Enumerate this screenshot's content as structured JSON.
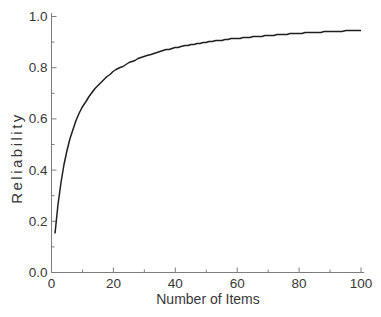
{
  "figure": {
    "background": "#ffffff",
    "axis_color": "#7d7d7d",
    "curve_color": "#1e1e1e",
    "text_color": "#383838"
  },
  "chart_data": {
    "type": "line",
    "title": "",
    "xlabel": "Number of Items",
    "ylabel": "Reliability",
    "xlim": [
      0,
      100
    ],
    "ylim": [
      0.0,
      1.0
    ],
    "grid": false,
    "legend": "none",
    "x_major_ticks": [
      0,
      20,
      40,
      60,
      80,
      100
    ],
    "x_major_tick_labels": [
      "0",
      "20",
      "40",
      "60",
      "80",
      "100"
    ],
    "x_minor_ticks": [
      10,
      30,
      50,
      70,
      90
    ],
    "y_major_ticks": [
      0.0,
      0.2,
      0.4,
      0.6,
      0.8,
      1.0
    ],
    "y_major_tick_labels": [
      "0.0",
      "0.2",
      "0.4",
      "0.6",
      "0.8",
      "1.0"
    ],
    "y_minor_ticks": [
      0.1,
      0.3,
      0.5,
      0.7,
      0.9
    ],
    "series": [
      {
        "name": "Reliability as a function of number of items (Spearman-Brown prophecy curve)",
        "model": "spearman_brown",
        "single_item_reliability": 0.155,
        "x_start": 1,
        "x_end": 100,
        "x_step": 1,
        "sample_points": [
          [
            1,
            0.155
          ],
          [
            2,
            0.268
          ],
          [
            5,
            0.478
          ],
          [
            10,
            0.647
          ],
          [
            20,
            0.786
          ],
          [
            30,
            0.846
          ],
          [
            40,
            0.88
          ],
          [
            50,
            0.902
          ],
          [
            60,
            0.917
          ],
          [
            70,
            0.928
          ],
          [
            80,
            0.936
          ],
          [
            90,
            0.943
          ],
          [
            100,
            0.948
          ]
        ]
      }
    ]
  }
}
